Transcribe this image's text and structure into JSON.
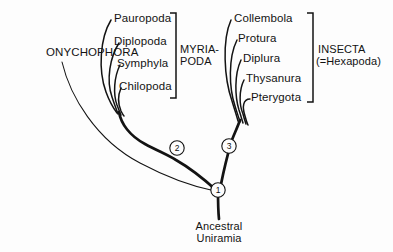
{
  "diagram": {
    "type": "cladogram",
    "root_label_line1": "Ancestral",
    "root_label_line2": "Uniramia",
    "outgroup_label": "ONYCHOPHORA",
    "colors": {
      "ink": "#131313",
      "background": "#fdfdfd"
    }
  },
  "taxa": {
    "myriapoda": [
      {
        "label": "Pauropoda"
      },
      {
        "label": "Diplopoda"
      },
      {
        "label": "Symphyla"
      },
      {
        "label": "Chilopoda"
      }
    ],
    "insecta": [
      {
        "label": "Collembola"
      },
      {
        "label": "Protura"
      },
      {
        "label": "Diplura"
      },
      {
        "label": "Thysanura"
      },
      {
        "label": "Pterygota"
      }
    ]
  },
  "groups": {
    "myriapoda": {
      "line1": "MYRIA-",
      "line2": "PODA"
    },
    "insecta": {
      "line1": "INSECTA",
      "line2": "(=Hexapoda)"
    }
  },
  "nodes": [
    {
      "id": "1",
      "label": "1"
    },
    {
      "id": "2",
      "label": "2"
    },
    {
      "id": "3",
      "label": "3"
    }
  ]
}
